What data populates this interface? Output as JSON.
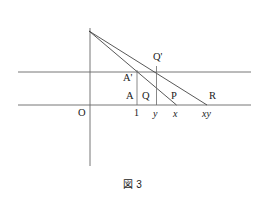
{
  "figure": {
    "caption": "図 3",
    "line_color": "#555555",
    "text_color": "#1a1a1a",
    "background": "#ffffff"
  },
  "axes": {
    "vertical_axis_label": "O",
    "horizontal_baseline_name": "x-axis",
    "upper_parallel_name": "upper-parallel-line"
  },
  "point_labels": {
    "a_prime": "A'",
    "q_prime": "Q'",
    "a": "A",
    "q": "Q",
    "p": "P",
    "r": "R",
    "origin": "O"
  },
  "tick_labels": {
    "one": "1",
    "y": "y",
    "x": "x",
    "xy": "xy"
  },
  "geometry": {
    "apex": {
      "x": 89,
      "y": 31
    },
    "vertical_axis": {
      "x": 90,
      "y_top": 28,
      "y_bottom": 166
    },
    "upper_line": {
      "y": 72,
      "x_start": 18,
      "x_end": 251
    },
    "lower_line": {
      "y": 105,
      "x_start": 18,
      "x_end": 251
    },
    "ticks": [
      {
        "label": "1",
        "x": 137
      },
      {
        "label": "y",
        "x": 156
      },
      {
        "label": "x",
        "x": 176
      },
      {
        "label": "xy",
        "x": 207
      }
    ],
    "rays": [
      {
        "name": "ray-to-P",
        "from": [
          89,
          31
        ],
        "to": [
          176,
          105
        ]
      },
      {
        "name": "ray-to-R",
        "from": [
          89,
          31
        ],
        "to": [
          207,
          105
        ]
      }
    ],
    "verticals": [
      {
        "name": "vertical-at-1",
        "x": 137,
        "y_top": 72,
        "y_bottom": 105
      },
      {
        "name": "vertical-at-y",
        "x": 156,
        "y_top": 67,
        "y_bottom": 105
      }
    ]
  }
}
